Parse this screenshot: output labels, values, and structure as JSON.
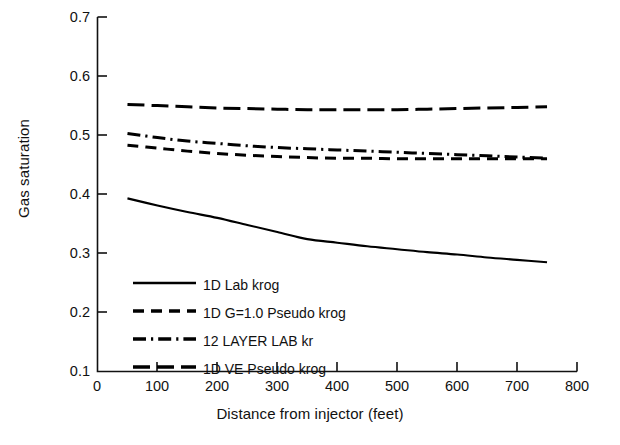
{
  "chart_data": {
    "type": "line",
    "title": "",
    "xlabel": "Distance from injector (feet)",
    "ylabel": "Gas saturation",
    "xlim": [
      0,
      800
    ],
    "ylim": [
      0.1,
      0.7
    ],
    "xticks": [
      "0",
      "100",
      "200",
      "300",
      "400",
      "500",
      "600",
      "700",
      "800"
    ],
    "yticks": [
      "0.1",
      "0.2",
      "0.3",
      "0.4",
      "0.5",
      "0.6",
      "0.7"
    ],
    "grid": false,
    "legend_position": "lower-left-inside",
    "series": [
      {
        "name": "1D Lab krog",
        "style": "solid",
        "color": "#000000",
        "x": [
          50,
          100,
          150,
          200,
          250,
          300,
          350,
          400,
          450,
          500,
          550,
          600,
          650,
          700,
          750
        ],
        "y": [
          0.393,
          0.381,
          0.37,
          0.36,
          0.348,
          0.336,
          0.324,
          0.318,
          0.312,
          0.307,
          0.302,
          0.298,
          0.293,
          0.289,
          0.285
        ]
      },
      {
        "name": "1D G=1.0 Pseudo krog",
        "style": "dashed",
        "color": "#000000",
        "x": [
          50,
          100,
          150,
          200,
          250,
          300,
          350,
          400,
          450,
          500,
          550,
          600,
          650,
          700,
          750
        ],
        "y": [
          0.483,
          0.478,
          0.473,
          0.469,
          0.466,
          0.464,
          0.462,
          0.461,
          0.461,
          0.46,
          0.46,
          0.46,
          0.46,
          0.46,
          0.46
        ]
      },
      {
        "name": "12 LAYER LAB kr",
        "style": "dash-dot",
        "color": "#000000",
        "x": [
          50,
          100,
          150,
          200,
          250,
          300,
          350,
          400,
          450,
          500,
          550,
          600,
          650,
          700,
          750
        ],
        "y": [
          0.503,
          0.496,
          0.49,
          0.486,
          0.482,
          0.479,
          0.477,
          0.475,
          0.473,
          0.471,
          0.469,
          0.467,
          0.465,
          0.463,
          0.461
        ]
      },
      {
        "name": "1D VE Pseudo krog",
        "style": "long-dash",
        "color": "#000000",
        "x": [
          50,
          100,
          150,
          200,
          250,
          300,
          350,
          400,
          450,
          500,
          550,
          600,
          650,
          700,
          750
        ],
        "y": [
          0.552,
          0.55,
          0.548,
          0.546,
          0.545,
          0.544,
          0.543,
          0.543,
          0.543,
          0.543,
          0.544,
          0.545,
          0.546,
          0.547,
          0.548
        ]
      }
    ],
    "legend": [
      {
        "label": "1D Lab krog",
        "style": "solid"
      },
      {
        "label": "1D G=1.0 Pseudo krog",
        "style": "dashed"
      },
      {
        "label": "12 LAYER LAB kr",
        "style": "dash-dot"
      },
      {
        "label": "1D VE Pseudo krog",
        "style": "long-dash"
      }
    ]
  }
}
